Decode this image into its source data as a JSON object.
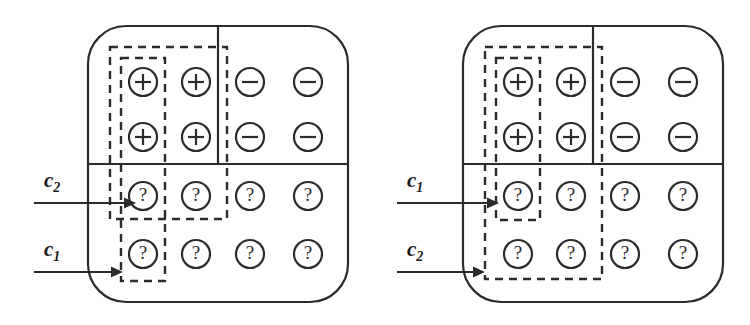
{
  "figure": {
    "type": "concept-learning-version-space-diagram",
    "panel_count": 2,
    "stroke_color": "#2b2b2b",
    "background_color": "#ffffff"
  },
  "grid": {
    "rows": 4,
    "cols": 4,
    "cell_symbols": [
      [
        "+",
        "+",
        "−",
        "−"
      ],
      [
        "+",
        "+",
        "−",
        "−"
      ],
      [
        "?",
        "?",
        "?",
        "?"
      ],
      [
        "?",
        "?",
        "?",
        "?"
      ]
    ],
    "symbol_names": {
      "+": "plus-circle",
      "−": "minus-circle",
      "?": "question-circle"
    }
  },
  "panels": [
    {
      "id": "left-panel",
      "name": "panel-a",
      "boxes": [
        {
          "id": "left-outer-box",
          "label": "c_2",
          "label_base": "c",
          "label_sub": "2",
          "cols": [
            1,
            2
          ],
          "rows": [
            1,
            3
          ],
          "style": "dashed",
          "nesting": "outer"
        },
        {
          "id": "left-inner-box",
          "label": "c_1",
          "label_base": "c",
          "label_sub": "1",
          "cols": [
            1,
            1
          ],
          "rows": [
            1,
            4
          ],
          "style": "dashed",
          "nesting": "inner"
        }
      ],
      "arrows": [
        {
          "id": "left-arrow-c2",
          "label_base": "c",
          "label_sub": "2",
          "target_row": 3,
          "target_box": "left-outer-box"
        },
        {
          "id": "left-arrow-c1",
          "label_base": "c",
          "label_sub": "1",
          "target_row": 4,
          "target_box": "left-inner-box"
        }
      ]
    },
    {
      "id": "right-panel",
      "name": "panel-b",
      "boxes": [
        {
          "id": "right-outer-box",
          "label": "c_2",
          "label_base": "c",
          "label_sub": "2",
          "cols": [
            1,
            2
          ],
          "rows": [
            1,
            4
          ],
          "style": "dashed",
          "nesting": "outer"
        },
        {
          "id": "right-inner-box",
          "label": "c_1",
          "label_base": "c",
          "label_sub": "1",
          "cols": [
            1,
            1
          ],
          "rows": [
            1,
            3
          ],
          "style": "dashed",
          "nesting": "inner"
        }
      ],
      "arrows": [
        {
          "id": "right-arrow-c1",
          "label_base": "c",
          "label_sub": "1",
          "target_row": 3,
          "target_box": "right-inner-box"
        },
        {
          "id": "right-arrow-c2",
          "label_base": "c",
          "label_sub": "2",
          "target_row": 4,
          "target_box": "right-outer-box"
        }
      ]
    }
  ],
  "labels": {
    "c1_base": "c",
    "c1_sub": "1",
    "c2_base": "c",
    "c2_sub": "2"
  }
}
